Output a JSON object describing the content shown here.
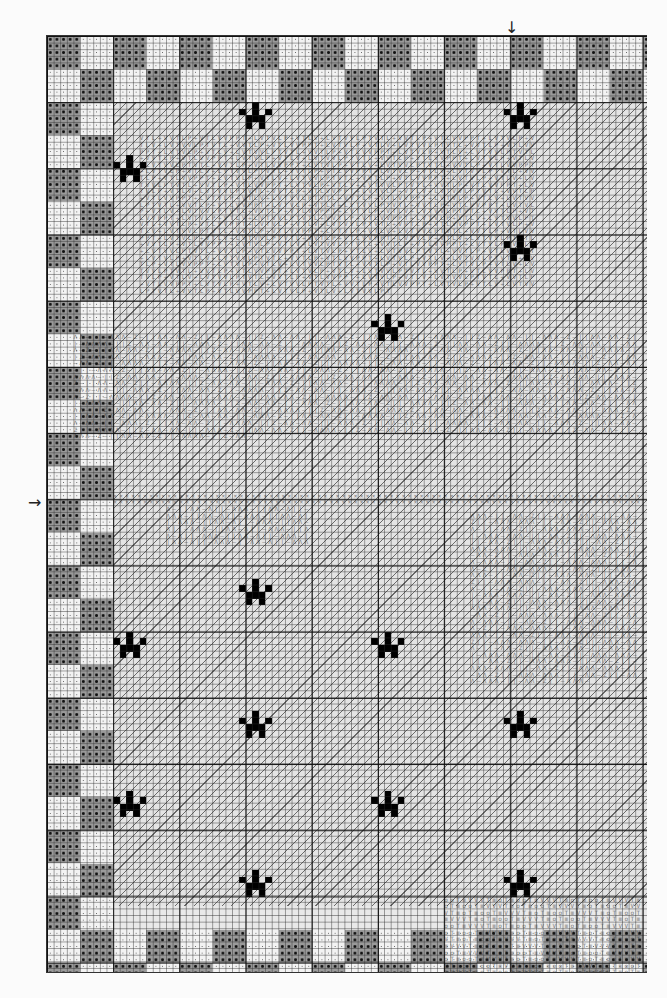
{
  "chart": {
    "type": "cross-stitch-pattern",
    "grid": {
      "cols": 90,
      "rows": 141,
      "cell_px": 6.62,
      "major_every": 10
    },
    "center_markers": {
      "top_arrow": "↓",
      "left_arrow": "→",
      "top_arrow_col": 70,
      "left_arrow_row": 71
    },
    "border": {
      "block_cells": 5,
      "depth_blocks": 2,
      "pattern": "alternating dark-dotted and light-dotted blocks"
    },
    "symbols": {
      "background": "/",
      "border_dark": "● ||",
      "border_light": "·",
      "cat_fur": "Λ – || Z",
      "cat_head": "V T L ÷ P",
      "whisker_row": "×",
      "paw": "■",
      "bottom_details": "o T ≡ V"
    },
    "paw_prints": [
      {
        "col": 11,
        "row": 18
      },
      {
        "col": 30,
        "row": 10
      },
      {
        "col": 70,
        "row": 10
      },
      {
        "col": 70,
        "row": 30
      },
      {
        "col": 50,
        "row": 42
      },
      {
        "col": 30,
        "row": 82
      },
      {
        "col": 11,
        "row": 90
      },
      {
        "col": 50,
        "row": 90
      },
      {
        "col": 30,
        "row": 102
      },
      {
        "col": 70,
        "row": 102
      },
      {
        "col": 11,
        "row": 114
      },
      {
        "col": 50,
        "row": 114
      },
      {
        "col": 30,
        "row": 126
      },
      {
        "col": 70,
        "row": 126
      }
    ],
    "zones": [
      {
        "name": "cat-head",
        "col": 14,
        "row": 15,
        "w": 60,
        "h": 35,
        "text": "VTL÷VVTLP÷VTLVVPPT÷LVTVLP÷VTLV÷LVTVVLPT"
      },
      {
        "name": "cat-fur",
        "col": 4,
        "row": 45,
        "w": 86,
        "h": 26,
        "text": "ΛΛ–||–ΛΛΛ–Z–||ΛΛ–ΛΛ–Z||–ΛΛΛΛ–||Z–ΛΛ–"
      },
      {
        "name": "whisker-row",
        "col": 10,
        "row": 69,
        "w": 80,
        "h": 2,
        "text": "××××××××××××××××××××××××××××××××××××××"
      },
      {
        "name": "cat-chin",
        "col": 18,
        "row": 71,
        "w": 22,
        "h": 6,
        "text": "Λ–||ΛΛ–Λ||–ΛΛ"
      },
      {
        "name": "cat-paw-right",
        "col": 64,
        "row": 72,
        "w": 26,
        "h": 26,
        "text": "ΛΛΛ–||–ΛΛ–Z||–ΛΛΛ–"
      },
      {
        "name": "bottom-details",
        "col": 60,
        "row": 130,
        "w": 30,
        "h": 12,
        "text": "ooT≡VVVT≡oT≡"
      }
    ]
  }
}
